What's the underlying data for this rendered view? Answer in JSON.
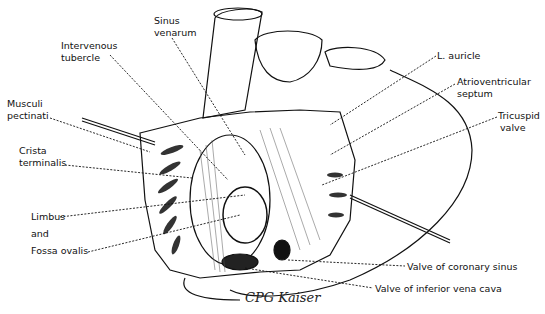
{
  "figure": {
    "signature": "CPG Kaiser",
    "ink_color": "#111111",
    "background": "#ffffff"
  },
  "labels": {
    "sinus_venarum": [
      "Sinus",
      "venarum"
    ],
    "intervenous_tubercle": [
      "Intervenous",
      "tubercle"
    ],
    "musculi_pectinati": [
      "Musculi",
      "pectinati"
    ],
    "crista_terminalis": [
      "Crista",
      "terminalis"
    ],
    "limbus": "Limbus",
    "and": "and",
    "fossa_ovalis": "Fossa ovalis",
    "l_auricle": "L. auricle",
    "atrioventricular_septum": [
      "Atrioventricular",
      "septum"
    ],
    "tricuspid_valve": [
      "Tricuspid",
      "valve"
    ],
    "valve_coronary_sinus": "Valve of coronary sinus",
    "valve_ivc": "Valve of inferior vena cava"
  }
}
